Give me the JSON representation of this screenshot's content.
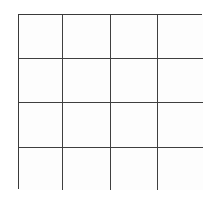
{
  "figure": {
    "name": "4x4 empty grid",
    "kind": "grid",
    "rows": 4,
    "columns": 4,
    "cell_count": 16,
    "line_color": "#3f3f3f",
    "border_color": "#3a3a3a",
    "cell_fill": "#fdfdfd",
    "background_color": "#ffffff",
    "line_width_px": 1.5,
    "bounds": {
      "left": 18,
      "top": 14,
      "right": 202,
      "bottom": 189,
      "width": 184,
      "height": 175
    },
    "vertical_line_x": [
      18,
      62,
      110,
      157,
      202
    ],
    "horizontal_line_y": [
      14,
      58,
      102,
      147,
      189
    ]
  },
  "cells": [
    [
      "",
      "",
      "",
      ""
    ],
    [
      "",
      "",
      "",
      ""
    ],
    [
      "",
      "",
      "",
      ""
    ],
    [
      "",
      "",
      "",
      ""
    ]
  ]
}
